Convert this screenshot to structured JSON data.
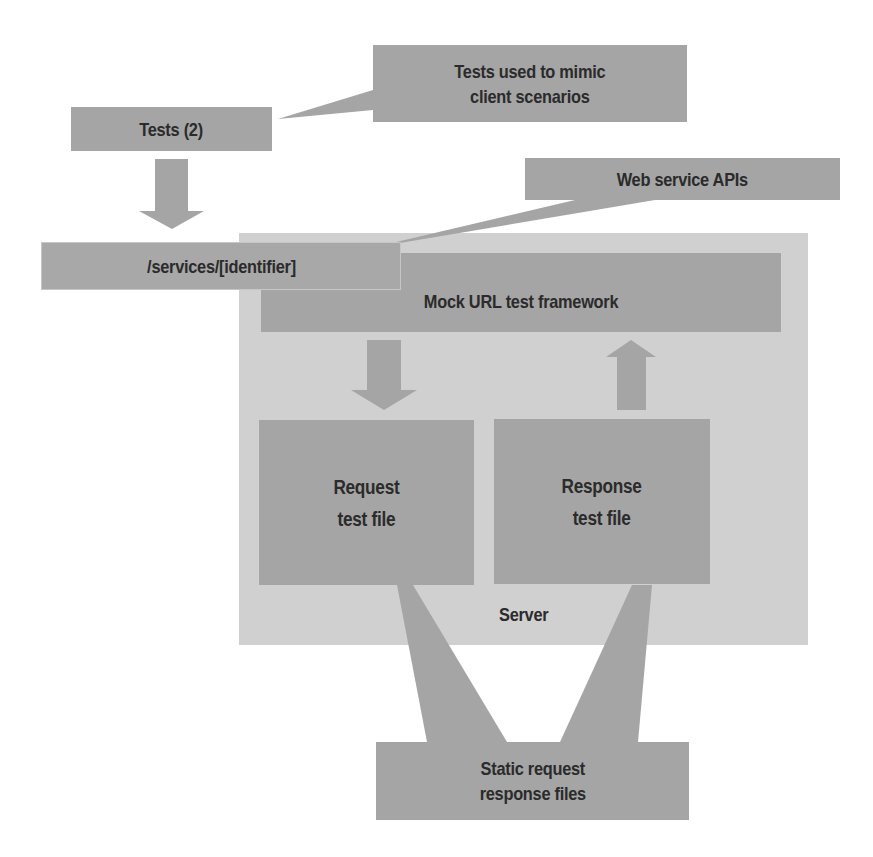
{
  "diagram": {
    "callouts": {
      "tests_note": "Tests used to mimic\nclient scenarios",
      "api_note": "Web service APIs",
      "static_note": "Static request\nresponse files"
    },
    "nodes": {
      "tests": "Tests (2)",
      "services_url": "/services/[identifier]",
      "framework": "Mock URL test framework",
      "request_file": "Request\ntest file",
      "response_file": "Response\ntest file",
      "server": "Server"
    },
    "arrows": [
      {
        "from": "tests",
        "to": "services_url",
        "direction": "down"
      },
      {
        "from": "framework",
        "to": "request_file",
        "direction": "down"
      },
      {
        "from": "response_file",
        "to": "framework",
        "direction": "up"
      }
    ],
    "colors": {
      "box_fill": "#a5a5a5",
      "server_fill": "#d0d0d0",
      "text": "#2b2b2b",
      "background": "#ffffff"
    }
  }
}
